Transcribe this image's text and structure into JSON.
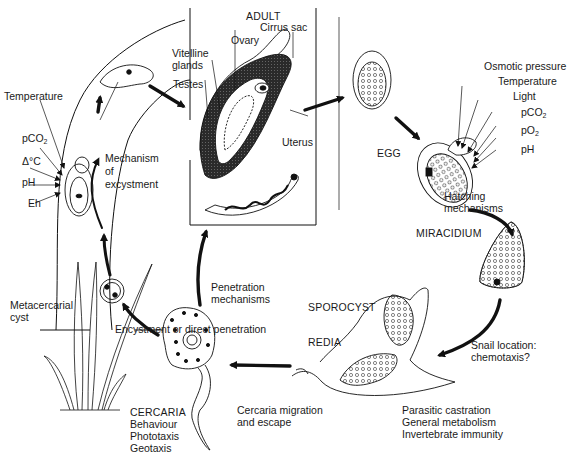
{
  "diagram": {
    "type": "life-cycle",
    "stages": {
      "adult": "ADULT",
      "egg": "EGG",
      "miracidium": "MIRACIDIUM",
      "sporocyst": "SPOROCYST",
      "redia": "REDIA",
      "cercaria": "CERCARIA",
      "metacercarial_cyst": "Metacercarial\ncyst"
    },
    "adult_anatomy": {
      "cirrus_sac": "Cirrus sac",
      "ovary": "Ovary",
      "vitelline_glands": "Vitelline\nglands",
      "testes": "Testes",
      "uterus": "Uterus"
    },
    "excystment": {
      "factors": [
        "Temperature",
        "pCO2",
        "Δ°C",
        "pH",
        "Eh"
      ],
      "label": "Mechanism\nof\nexcystment"
    },
    "hatching": {
      "factors": [
        "Osmotic pressure",
        "Temperature",
        "Light",
        "pCO2",
        "pO2",
        "pH"
      ],
      "label": "Hatching\nmechanisms"
    },
    "snail_location": "Snail location:\nchemotaxis?",
    "snail_effects": [
      "Parasitic castration",
      "General metabolism",
      "Invertebrate immunity"
    ],
    "cercaria_behaviour": [
      "Behaviour",
      "Phototaxis",
      "Geotaxis"
    ],
    "cercaria_migration": "Cercaria migration\nand escape",
    "encystment": "Encystment or direct penetration",
    "penetration": "Penetration\nmechanisms"
  }
}
